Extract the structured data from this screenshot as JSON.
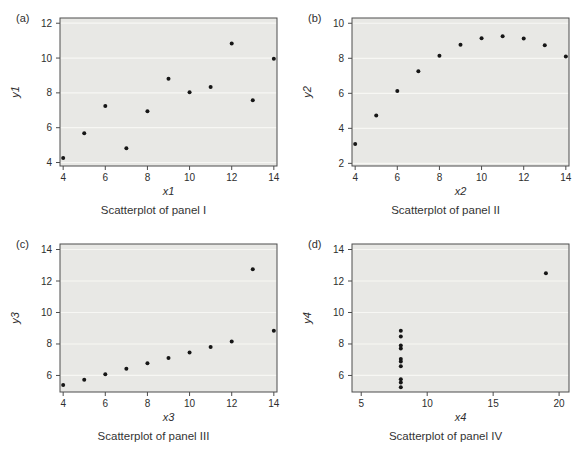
{
  "figure": {
    "background": "#ffffff"
  },
  "colors": {
    "plot_bg": "#e8e8e5",
    "gridline": "#f7f7f4",
    "frame": "#4c4c4c",
    "point": "#161616",
    "text": "#2e2e2e"
  },
  "chart_data": [
    {
      "type": "scatter",
      "panel_label": "(a)",
      "title": "Scatterplot of panel I",
      "xlabel": "x1",
      "ylabel": "y1",
      "xlim": [
        3.85,
        14.15
      ],
      "ylim": [
        3.8,
        12.3
      ],
      "xticks": [
        4,
        6,
        8,
        10,
        12,
        14
      ],
      "yticks": [
        4,
        6,
        8,
        10,
        12
      ],
      "grid": "horizontal",
      "x": [
        10,
        8,
        13,
        9,
        11,
        14,
        6,
        4,
        12,
        7,
        5
      ],
      "y": [
        8.04,
        6.95,
        7.58,
        8.81,
        8.33,
        9.96,
        7.24,
        4.26,
        10.84,
        4.82,
        5.68
      ]
    },
    {
      "type": "scatter",
      "panel_label": "(b)",
      "title": "Scatterplot of panel II",
      "xlabel": "x2",
      "ylabel": "y2",
      "xlim": [
        3.85,
        14.15
      ],
      "ylim": [
        1.85,
        10.3
      ],
      "xticks": [
        4,
        6,
        8,
        10,
        12,
        14
      ],
      "yticks": [
        2,
        4,
        6,
        8,
        10
      ],
      "grid": "horizontal",
      "x": [
        10,
        8,
        13,
        9,
        11,
        14,
        6,
        4,
        12,
        7,
        5
      ],
      "y": [
        9.14,
        8.14,
        8.74,
        8.77,
        9.26,
        8.1,
        6.13,
        3.1,
        9.13,
        7.26,
        4.74
      ]
    },
    {
      "type": "scatter",
      "panel_label": "(c)",
      "title": "Scatterplot of panel III",
      "xlabel": "x3",
      "ylabel": "y3",
      "xlim": [
        3.85,
        14.15
      ],
      "ylim": [
        4.95,
        14.35
      ],
      "xticks": [
        4,
        6,
        8,
        10,
        12,
        14
      ],
      "yticks": [
        6,
        8,
        10,
        12,
        14
      ],
      "grid": "horizontal",
      "x": [
        10,
        8,
        13,
        9,
        11,
        14,
        6,
        4,
        12,
        7,
        5
      ],
      "y": [
        7.46,
        6.77,
        12.74,
        7.11,
        7.81,
        8.84,
        6.08,
        5.39,
        8.15,
        6.42,
        5.73
      ]
    },
    {
      "type": "scatter",
      "panel_label": "(d)",
      "title": "Scatterplot of panel IV",
      "xlabel": "x4",
      "ylabel": "y4",
      "xlim": [
        4.3,
        20.75
      ],
      "ylim": [
        4.95,
        14.35
      ],
      "xticks": [
        5,
        10,
        15,
        20
      ],
      "yticks": [
        6,
        8,
        10,
        12,
        14
      ],
      "grid": "horizontal",
      "x": [
        8,
        8,
        8,
        8,
        8,
        8,
        8,
        19,
        8,
        8,
        8
      ],
      "y": [
        6.58,
        5.76,
        7.71,
        8.84,
        8.47,
        7.04,
        5.25,
        12.5,
        5.56,
        7.91,
        6.89
      ]
    }
  ]
}
